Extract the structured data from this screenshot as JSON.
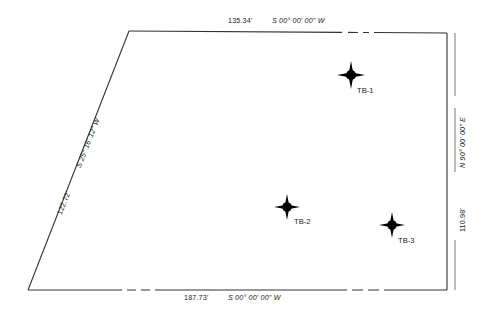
{
  "drawing": {
    "type": "survey-plat",
    "line_color": "#333333",
    "marker_color": "#000000",
    "background": "#ffffff"
  },
  "courses": {
    "north": {
      "distance": "135.34'",
      "bearing": "S 00° 00' 00\" W",
      "label": "135.34'   S 00° 00' 00\" W"
    },
    "east": {
      "distance": "110.98'",
      "bearing": "N 90° 00' 00\" E",
      "label": "110.98'   N 90° 00' 00\" E"
    },
    "south": {
      "distance": "187.73'",
      "bearing": "S 00° 00' 00\" W",
      "label": "187.73'   S 00° 00' 00\" W"
    },
    "west": {
      "distance": "122.72'",
      "bearing": "S 25° 16' 12\" W",
      "label": "122.72'   S 25° 16' 12\" W"
    }
  },
  "points": [
    {
      "id": "TB-1",
      "label": "TB-1",
      "x": 351,
      "y": 75,
      "label_x": 357,
      "label_y": 87
    },
    {
      "id": "TB-2",
      "label": "TB-2",
      "x": 287,
      "y": 207,
      "label_x": 294,
      "label_y": 218
    },
    {
      "id": "TB-3",
      "label": "TB-3",
      "x": 392,
      "y": 225,
      "label_x": 398,
      "label_y": 237
    }
  ],
  "boundary": {
    "corners": [
      {
        "name": "top-left",
        "x": 129,
        "y": 31
      },
      {
        "name": "top-right",
        "x": 447,
        "y": 33
      },
      {
        "name": "bottom-right",
        "x": 447,
        "y": 290
      },
      {
        "name": "bottom-left",
        "x": 28,
        "y": 290
      }
    ]
  }
}
